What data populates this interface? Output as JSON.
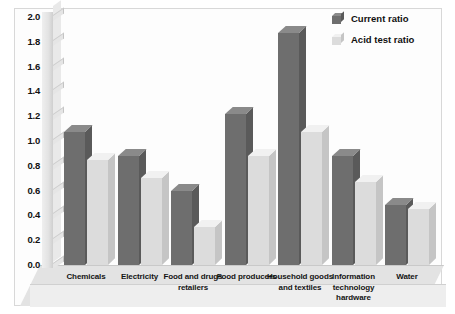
{
  "chart_data": {
    "type": "bar",
    "title": "",
    "xlabel": "",
    "ylabel": "",
    "ylim": [
      0.0,
      2.0
    ],
    "ytick_step": 0.2,
    "grid": false,
    "legend_position": "top-right",
    "style": "3d-column",
    "categories": [
      "Chemicals",
      "Electricity",
      "Food and drugs retailers",
      "Food producers",
      "Household goods and textiles",
      "Information technology hardware",
      "Water"
    ],
    "ytick_labels": [
      "2.0",
      "1.8",
      "1.6",
      "1.4",
      "1.2",
      "1.0",
      "0.8",
      "0.6",
      "0.4",
      "0.2",
      "0.0"
    ],
    "series": [
      {
        "name": "Current ratio",
        "color": "#6e6e6e",
        "values": [
          1.07,
          0.88,
          0.6,
          1.22,
          1.87,
          0.88,
          0.48
        ]
      },
      {
        "name": "Acid test ratio",
        "color": "#dcdcdc",
        "values": [
          0.85,
          0.7,
          0.31,
          0.88,
          1.07,
          0.67,
          0.45
        ]
      }
    ]
  },
  "legend": {
    "items": [
      {
        "label": "Current ratio",
        "swatch": "current-ratio-swatch"
      },
      {
        "label": "Acid test ratio",
        "swatch": "acid-test-ratio-swatch"
      }
    ]
  }
}
